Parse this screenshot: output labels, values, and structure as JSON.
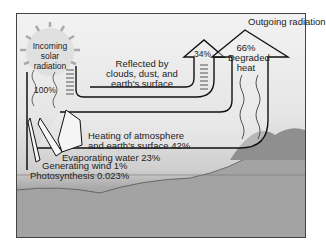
{
  "title": "Outgoing radiation",
  "incoming": {
    "line1": "Incoming",
    "line2": "solar",
    "line3": "radiation",
    "percent": "100%"
  },
  "reflected": {
    "line1": "Reflected by",
    "line2": "clouds, dust, and",
    "line3": "earth's surface",
    "percent": "34%"
  },
  "degraded": {
    "percent": "66%",
    "line1": "Degraded",
    "line2": "heat"
  },
  "heating": {
    "line1": "Heating of atmosphere",
    "line2": "and earth's surface 42%"
  },
  "evaporating": "Evaporating water 23%",
  "wind": "Generating wind 1%",
  "photosynthesis": "Photosynthesis 0.023%",
  "colors": {
    "frame": "#444444",
    "arrow": "#111111",
    "arrow_fill": "#ececec",
    "ground": "#9e9e9e",
    "sky": "#f2f2f2"
  }
}
